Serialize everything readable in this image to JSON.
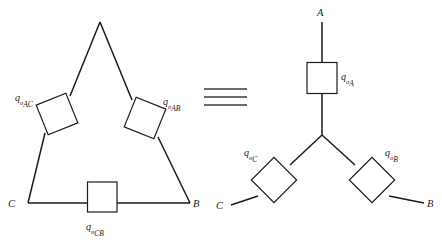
{
  "figure": {
    "caption": "",
    "equivalence_symbol": "≡",
    "stroke_color": "#1b1b1b",
    "background_color": "#ffffff"
  },
  "delta_network": {
    "name": "delta-connected-network",
    "vertices": [
      {
        "id": "A",
        "label": "",
        "x": 100,
        "y": 22
      },
      {
        "id": "C",
        "label": "C",
        "x": 28,
        "y": 203
      },
      {
        "id": "B",
        "label": "B",
        "x": 190,
        "y": 203
      }
    ],
    "vertex_labels": {
      "C": "C",
      "B": "B"
    },
    "elements": [
      {
        "id": "q-o-AC",
        "q": "q",
        "sub_o": "o",
        "sub_index": "AC",
        "orientation": "rotated",
        "cx": 57,
        "cy": 114
      },
      {
        "id": "q-o-AB",
        "q": "q",
        "sub_o": "o",
        "sub_index": "AB",
        "orientation": "rotated",
        "cx": 145,
        "cy": 118
      },
      {
        "id": "q-o-CB",
        "q": "q",
        "sub_o": "o",
        "sub_index": "CB",
        "orientation": "axis-aligned",
        "cx": 102,
        "cy": 197
      }
    ]
  },
  "wye_network": {
    "name": "wye-connected-network",
    "center": {
      "x": 322,
      "y": 135
    },
    "terminals": [
      {
        "id": "A",
        "label": "A",
        "x": 322,
        "y": 18
      },
      {
        "id": "C",
        "label": "C",
        "x": 231,
        "y": 205
      },
      {
        "id": "B",
        "label": "B",
        "x": 424,
        "y": 203
      }
    ],
    "terminal_labels": {
      "A": "A",
      "C": "C",
      "B": "B"
    },
    "elements": [
      {
        "id": "q-o-A",
        "q": "q",
        "sub_o": "o",
        "sub_index": "A",
        "orientation": "axis-aligned",
        "cx": 322,
        "cy": 78
      },
      {
        "id": "q-o-C",
        "q": "q",
        "sub_o": "o",
        "sub_index": "C",
        "orientation": "rotated",
        "cx": 274,
        "cy": 180
      },
      {
        "id": "q-o-B",
        "q": "q",
        "sub_o": "o",
        "sub_index": "B",
        "orientation": "rotated",
        "cx": 372,
        "cy": 180
      }
    ]
  }
}
